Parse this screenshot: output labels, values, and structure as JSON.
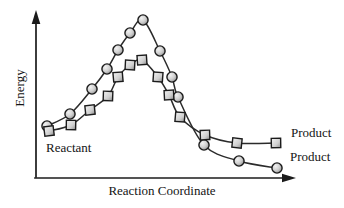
{
  "figure": {
    "labels": {
      "y_axis": "Energy",
      "x_axis": "Reaction Coordinate",
      "reactant": "Reactant",
      "product_upper": "Product",
      "product_lower": "Product"
    },
    "colors": {
      "background": "#ffffff",
      "ink": "#1b1b1b",
      "line": "#2b2b2b",
      "marker_stroke": "#1b1b1b",
      "marker_light": "#f2f2f2",
      "marker_mid": "#cfcfcf",
      "marker_dark": "#8f8f8f",
      "text": "#141414"
    }
  },
  "chart_data": {
    "type": "line",
    "title": "",
    "xlabel": "Reaction Coordinate",
    "ylabel": "Energy",
    "axes_numeric": false,
    "grid": false,
    "legend_position": "none",
    "annotations": [
      "Reactant",
      "Product",
      "Product"
    ],
    "axis_px": {
      "origin": [
        36,
        178
      ],
      "x_arrow_tip": [
        296,
        178
      ],
      "y_arrow_tip": [
        36,
        10
      ]
    },
    "series": [
      {
        "id": "circle-series",
        "marker": "circle",
        "name": "High-peak pathway (lower-energy Product)",
        "end_label": "Product",
        "points_px": [
          [
            47,
            126
          ],
          [
            70,
            114
          ],
          [
            92,
            89
          ],
          [
            107,
            69
          ],
          [
            118,
            50
          ],
          [
            130,
            33
          ],
          [
            143,
            20
          ],
          [
            160,
            51
          ],
          [
            172,
            77
          ],
          [
            178,
            97
          ],
          [
            204,
            145
          ],
          [
            239,
            161
          ],
          [
            277,
            168
          ]
        ]
      },
      {
        "id": "square-series",
        "marker": "square",
        "name": "Low-peak pathway (higher-energy Product)",
        "end_label": "Product",
        "points_px": [
          [
            49,
            131
          ],
          [
            71,
            125
          ],
          [
            90,
            110
          ],
          [
            108,
            96
          ],
          [
            118,
            77
          ],
          [
            130,
            65
          ],
          [
            142,
            60
          ],
          [
            158,
            77
          ],
          [
            169,
            95
          ],
          [
            180,
            117
          ],
          [
            205,
            135
          ],
          [
            237,
            143
          ],
          [
            276,
            143
          ]
        ]
      }
    ]
  }
}
